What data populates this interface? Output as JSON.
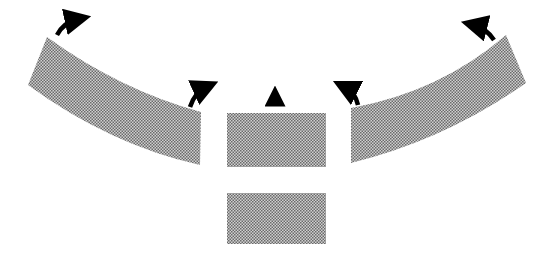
{
  "diagram": {
    "colors": {
      "background": "#ffffff",
      "halftone_dark": "#6e6e6e",
      "halftone_light": "#d2d2d2",
      "arrow": "#000000"
    },
    "shapes": [
      {
        "id": "left-band",
        "type": "curved-band"
      },
      {
        "id": "center-top-block",
        "type": "rectangle"
      },
      {
        "id": "center-bottom-block",
        "type": "rectangle"
      },
      {
        "id": "right-band",
        "type": "curved-band"
      }
    ],
    "arrows": [
      {
        "id": "arrow-left-outer",
        "direction": "up-right"
      },
      {
        "id": "arrow-left-inner",
        "direction": "up-right"
      },
      {
        "id": "arrow-center",
        "direction": "up"
      },
      {
        "id": "arrow-right-inner",
        "direction": "up-left"
      },
      {
        "id": "arrow-right-outer",
        "direction": "up-left"
      }
    ]
  }
}
